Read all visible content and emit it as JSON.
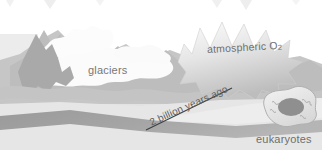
{
  "figure": {
    "kind": "geologic-timeline-illustration",
    "palette": {
      "background": "#ffffff",
      "sky_band": "#ededed",
      "ground_band": "#dcdcdc",
      "mid_gray": "#c9c9c9",
      "dark_gray": "#a8a8a8",
      "timeline_band": "#9e9e9e",
      "glacier_white": "#fbfbfb",
      "text": "#6e6e6e",
      "nucleus": "#8f8f8f"
    },
    "labels": {
      "glaciers": "glaciers",
      "atmospheric_o2_text": "atmospheric O",
      "atmospheric_o2_subscript": "2",
      "timeline": "2 billion years ago",
      "eukaryotes": "eukaryotes"
    },
    "elements": {
      "glacier_mass": "glacier-mass",
      "starburst": "atmospheric-oxygen-burst",
      "timeline_band": "timeline-band",
      "leader_line": "timeline-leader-line",
      "eukaryote_cell": "eukaryote-cell",
      "nucleus": "cell-nucleus",
      "mountain_peak": "dark-mountain-peak"
    }
  }
}
